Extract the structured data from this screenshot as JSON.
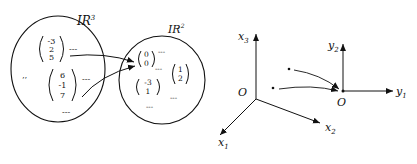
{
  "left_diagram": {
    "domain_label": "IR",
    "domain_exp": "3",
    "codomain_label": "IR",
    "codomain_exp": "2",
    "domain_vectors": [
      {
        "components": [
          "-3",
          "2",
          "5"
        ]
      },
      {
        "components": [
          "6",
          "-1",
          "7"
        ]
      }
    ],
    "codomain_vectors": [
      {
        "components": [
          "0",
          "0"
        ]
      },
      {
        "components": [
          "1",
          "2"
        ]
      },
      {
        "components": [
          "-3",
          "1"
        ]
      }
    ],
    "ellipsis": "---",
    "dots": "’’"
  },
  "right_diagram": {
    "origin_left": "O",
    "axis_x1": "x",
    "axis_x1_sub": "1",
    "axis_x2": "x",
    "axis_x2_sub": "2",
    "axis_x3": "x",
    "axis_x3_sub": "3",
    "origin_right": "O",
    "axis_y1": "y",
    "axis_y1_sub": "1",
    "axis_y2": "y",
    "axis_y2_sub": "2"
  },
  "colors": {
    "ink": "#111111",
    "background": "#ffffff"
  }
}
